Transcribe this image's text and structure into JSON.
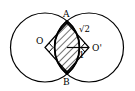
{
  "diagram": {
    "type": "geometry",
    "points": {
      "A": "A",
      "B": "B",
      "O": "O",
      "O_prime": "O'"
    },
    "lengths": {
      "side_AO_prime": "√2",
      "segment_to_O_prime": "1"
    },
    "stroke_color": "#000000",
    "background_color": "#ffffff"
  }
}
